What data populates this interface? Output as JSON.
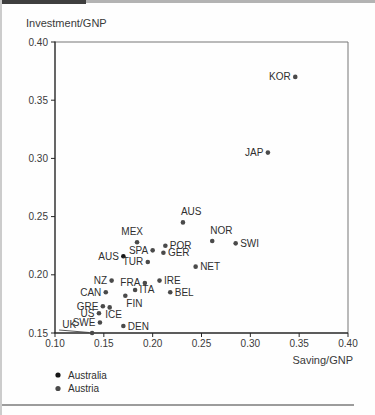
{
  "page_edges": {
    "top_bar_dark_color": "#3f3f3f",
    "top_bar_light_color": "#b3b3b3",
    "left_edge_color": "#cccccc",
    "bottom_rule_color": "#9c9c9c"
  },
  "chart_data": {
    "type": "scatter",
    "title": "",
    "xlabel": "Saving/GNP",
    "ylabel": "Investment/GNP",
    "xlim": [
      0.1,
      0.4
    ],
    "ylim": [
      0.15,
      0.4
    ],
    "x_ticks": [
      "0.10",
      "0.15",
      "0.20",
      "0.25",
      "0.30",
      "0.35",
      "0.40"
    ],
    "y_ticks": [
      "0.15",
      "0.20",
      "0.25",
      "0.30",
      "0.35",
      "0.40"
    ],
    "grid": false,
    "point_color_gray": "#4a4a4a",
    "point_color_black": "#161616",
    "legend_position": "bottom-left",
    "legend": [
      {
        "label": "Australia",
        "color": "#161616"
      },
      {
        "label": "Austria",
        "color": "#4a4a4a"
      }
    ],
    "points": [
      {
        "label": "KOR",
        "x": 0.346,
        "y": 0.37,
        "placement": "left"
      },
      {
        "label": "JAP",
        "x": 0.318,
        "y": 0.305,
        "placement": "left"
      },
      {
        "label": "AUS",
        "x": 0.231,
        "y": 0.245,
        "placement": "above-right",
        "series": "Austria"
      },
      {
        "label": "NOR",
        "x": 0.261,
        "y": 0.229,
        "placement": "above-right"
      },
      {
        "label": "SWI",
        "x": 0.285,
        "y": 0.227,
        "placement": "right"
      },
      {
        "label": "MEX",
        "x": 0.184,
        "y": 0.228,
        "placement": "above-left"
      },
      {
        "label": "POR",
        "x": 0.213,
        "y": 0.225,
        "placement": "right"
      },
      {
        "label": "SPA",
        "x": 0.2,
        "y": 0.221,
        "placement": "left"
      },
      {
        "label": "GER",
        "x": 0.211,
        "y": 0.219,
        "placement": "right"
      },
      {
        "label": "AUS",
        "x": 0.17,
        "y": 0.216,
        "placement": "left",
        "series": "Australia",
        "black": true
      },
      {
        "label": "TUR",
        "x": 0.195,
        "y": 0.211,
        "placement": "left"
      },
      {
        "label": "NET",
        "x": 0.244,
        "y": 0.207,
        "placement": "right"
      },
      {
        "label": "NZ",
        "x": 0.158,
        "y": 0.195,
        "placement": "left"
      },
      {
        "label": "IRE",
        "x": 0.207,
        "y": 0.195,
        "placement": "right"
      },
      {
        "label": "FRA",
        "x": 0.192,
        "y": 0.193,
        "placement": "left"
      },
      {
        "label": "ITA",
        "x": 0.182,
        "y": 0.187,
        "placement": "right"
      },
      {
        "label": "CAN",
        "x": 0.152,
        "y": 0.185,
        "placement": "left"
      },
      {
        "label": "BEL",
        "x": 0.218,
        "y": 0.185,
        "placement": "right"
      },
      {
        "label": "FIN",
        "x": 0.172,
        "y": 0.182,
        "placement": "below-right"
      },
      {
        "label": "GRE",
        "x": 0.149,
        "y": 0.173,
        "placement": "left"
      },
      {
        "label": "ICE",
        "x": 0.156,
        "y": 0.172,
        "placement": "below"
      },
      {
        "label": "US",
        "x": 0.145,
        "y": 0.167,
        "placement": "left"
      },
      {
        "label": "SWE",
        "x": 0.146,
        "y": 0.159,
        "placement": "left"
      },
      {
        "label": "UK",
        "x": 0.138,
        "y": 0.15,
        "placement": "left-leader"
      },
      {
        "label": "DEN",
        "x": 0.17,
        "y": 0.156,
        "placement": "right"
      }
    ]
  }
}
